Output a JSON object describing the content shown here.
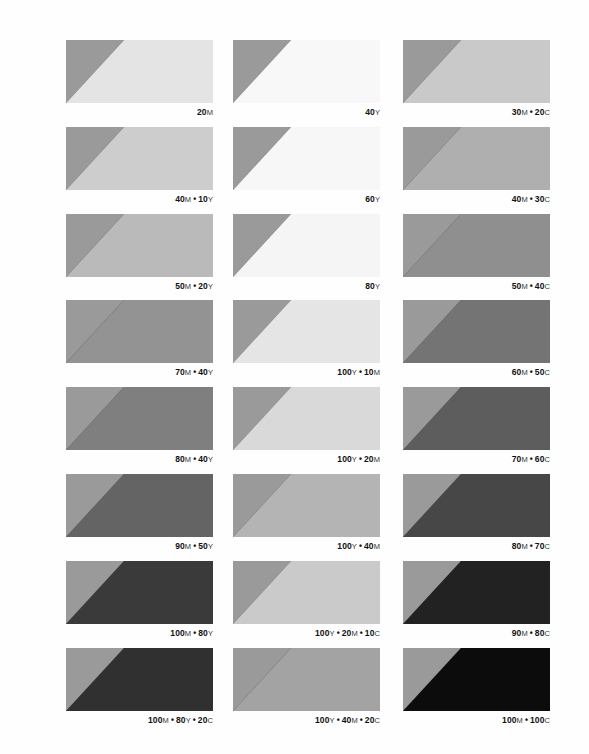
{
  "page": {
    "triangle_color": "#9a9a9a",
    "columns_x": [
      66,
      233,
      403
    ],
    "rows_y": [
      40,
      127,
      214,
      300,
      387,
      474,
      561,
      648
    ]
  },
  "swatches": [
    {
      "row": 0,
      "col": 0,
      "label": "20M",
      "parts": [
        [
          "20",
          "M"
        ]
      ],
      "fill": "#e4e4e4"
    },
    {
      "row": 0,
      "col": 1,
      "label": "40Y",
      "parts": [
        [
          "40",
          "Y"
        ]
      ],
      "fill": "#f8f8f8"
    },
    {
      "row": 0,
      "col": 2,
      "label": "30M • 20C",
      "parts": [
        [
          "30",
          "M"
        ],
        [
          "20",
          "C"
        ]
      ],
      "fill": "#c9c9c9"
    },
    {
      "row": 1,
      "col": 0,
      "label": "40M • 10Y",
      "parts": [
        [
          "40",
          "M"
        ],
        [
          "10",
          "Y"
        ]
      ],
      "fill": "#cdcdcd"
    },
    {
      "row": 1,
      "col": 1,
      "label": "60Y",
      "parts": [
        [
          "60",
          "Y"
        ]
      ],
      "fill": "#f7f7f7"
    },
    {
      "row": 1,
      "col": 2,
      "label": "40M • 30C",
      "parts": [
        [
          "40",
          "M"
        ],
        [
          "30",
          "C"
        ]
      ],
      "fill": "#afafaf"
    },
    {
      "row": 2,
      "col": 0,
      "label": "50M • 20Y",
      "parts": [
        [
          "50",
          "M"
        ],
        [
          "20",
          "Y"
        ]
      ],
      "fill": "#bababa"
    },
    {
      "row": 2,
      "col": 1,
      "label": "80Y",
      "parts": [
        [
          "80",
          "Y"
        ]
      ],
      "fill": "#f5f5f5"
    },
    {
      "row": 2,
      "col": 2,
      "label": "50M • 40C",
      "parts": [
        [
          "50",
          "M"
        ],
        [
          "40",
          "C"
        ]
      ],
      "fill": "#8f8f8f"
    },
    {
      "row": 3,
      "col": 0,
      "label": "70M • 40Y",
      "parts": [
        [
          "70",
          "M"
        ],
        [
          "40",
          "Y"
        ]
      ],
      "fill": "#939393"
    },
    {
      "row": 3,
      "col": 1,
      "label": "100Y • 10M",
      "parts": [
        [
          "100",
          "Y"
        ],
        [
          "10",
          "M"
        ]
      ],
      "fill": "#e5e5e5"
    },
    {
      "row": 3,
      "col": 2,
      "label": "60M • 50C",
      "parts": [
        [
          "60",
          "M"
        ],
        [
          "50",
          "C"
        ]
      ],
      "fill": "#747474"
    },
    {
      "row": 4,
      "col": 0,
      "label": "80M • 40Y",
      "parts": [
        [
          "80",
          "M"
        ],
        [
          "40",
          "Y"
        ]
      ],
      "fill": "#7f7f7f"
    },
    {
      "row": 4,
      "col": 1,
      "label": "100Y • 20M",
      "parts": [
        [
          "100",
          "Y"
        ],
        [
          "20",
          "M"
        ]
      ],
      "fill": "#d9d9d9"
    },
    {
      "row": 4,
      "col": 2,
      "label": "70M • 60C",
      "parts": [
        [
          "70",
          "M"
        ],
        [
          "60",
          "C"
        ]
      ],
      "fill": "#5d5d5d"
    },
    {
      "row": 5,
      "col": 0,
      "label": "90M • 50Y",
      "parts": [
        [
          "90",
          "M"
        ],
        [
          "50",
          "Y"
        ]
      ],
      "fill": "#646464"
    },
    {
      "row": 5,
      "col": 1,
      "label": "100Y • 40M",
      "parts": [
        [
          "100",
          "Y"
        ],
        [
          "40",
          "M"
        ]
      ],
      "fill": "#b4b4b4"
    },
    {
      "row": 5,
      "col": 2,
      "label": "80M • 70C",
      "parts": [
        [
          "80",
          "M"
        ],
        [
          "70",
          "C"
        ]
      ],
      "fill": "#474747"
    },
    {
      "row": 6,
      "col": 0,
      "label": "100M • 80Y",
      "parts": [
        [
          "100",
          "M"
        ],
        [
          "80",
          "Y"
        ]
      ],
      "fill": "#3a3a3a"
    },
    {
      "row": 6,
      "col": 1,
      "label": "100Y • 20M • 10C",
      "parts": [
        [
          "100",
          "Y"
        ],
        [
          "20",
          "M"
        ],
        [
          "10",
          "C"
        ]
      ],
      "fill": "#cacaca"
    },
    {
      "row": 6,
      "col": 2,
      "label": "90M • 80C",
      "parts": [
        [
          "90",
          "M"
        ],
        [
          "80",
          "C"
        ]
      ],
      "fill": "#222222"
    },
    {
      "row": 7,
      "col": 0,
      "label": "100M • 80Y • 20C",
      "parts": [
        [
          "100",
          "M"
        ],
        [
          "80",
          "Y"
        ],
        [
          "20",
          "C"
        ]
      ],
      "fill": "#303030"
    },
    {
      "row": 7,
      "col": 1,
      "label": "100Y • 40M • 20C",
      "parts": [
        [
          "100",
          "Y"
        ],
        [
          "40",
          "M"
        ],
        [
          "20",
          "C"
        ]
      ],
      "fill": "#a3a3a3"
    },
    {
      "row": 7,
      "col": 2,
      "label": "100M • 100C",
      "parts": [
        [
          "100",
          "M"
        ],
        [
          "100",
          "C"
        ]
      ],
      "fill": "#0c0c0c"
    }
  ]
}
